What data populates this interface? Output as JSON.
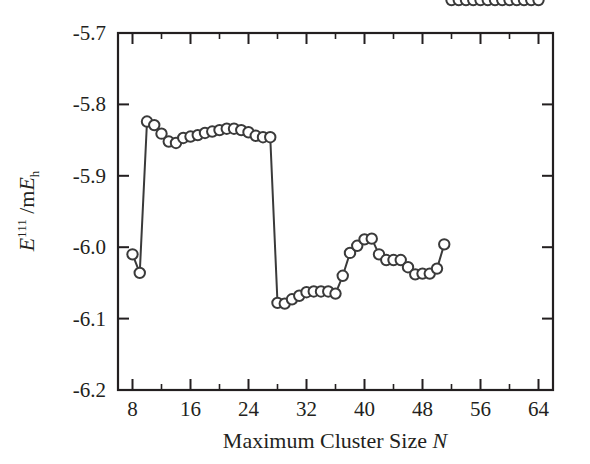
{
  "chart_data": {
    "type": "line",
    "title": "",
    "subtitle": "",
    "xlabel": "Maximum Cluster Size N",
    "ylabel": "E^111 /mE_h",
    "ylabel_parts": {
      "symbol": "E",
      "superscript": "111",
      "separator": " /m",
      "unit_symbol": "E",
      "unit_subscript": "h"
    },
    "xlim": [
      6,
      66
    ],
    "ylim": [
      -6.2,
      -5.7
    ],
    "xticks": [
      8,
      16,
      24,
      32,
      40,
      48,
      56,
      64
    ],
    "xtick_labels": [
      "8",
      "16",
      "24",
      "32",
      "40",
      "48",
      "56",
      "64"
    ],
    "xminor_ticks": [
      12,
      20,
      28,
      36,
      44,
      52,
      60
    ],
    "yticks": [
      -5.7,
      -5.8,
      -5.9,
      -6.0,
      -6.1,
      -6.2
    ],
    "ytick_labels": [
      "-5.7",
      "-5.8",
      "-5.9",
      "-6.0",
      "-6.1",
      "-6.2"
    ],
    "grid": false,
    "legend": null,
    "marker": "open-circle",
    "line_color": "#3a3a3a",
    "marker_face_color": "#ffffff",
    "x": [
      8,
      9,
      10,
      11,
      12,
      13,
      14,
      15,
      16,
      17,
      18,
      19,
      20,
      21,
      22,
      23,
      24,
      25,
      26,
      27,
      28,
      29,
      30,
      31,
      32,
      33,
      34,
      35,
      36,
      37,
      38,
      39,
      40,
      41,
      42,
      43,
      44,
      45,
      46,
      47,
      48,
      49,
      50,
      51,
      52,
      53,
      54,
      55,
      56,
      57,
      58,
      59,
      60,
      61,
      62,
      63,
      64
    ],
    "y": [
      -6.01,
      -6.036,
      -5.824,
      -5.829,
      -5.841,
      -5.852,
      -5.854,
      -5.847,
      -5.845,
      -5.843,
      -5.84,
      -5.838,
      -5.836,
      -5.834,
      -5.834,
      -5.836,
      -5.839,
      -5.844,
      -5.846,
      -5.846,
      -6.078,
      -6.079,
      -6.073,
      -6.068,
      -6.063,
      -6.062,
      -6.062,
      -6.062,
      -6.065,
      -6.04,
      -6.008,
      -5.998,
      -5.989,
      -5.988,
      -6.01,
      -6.018,
      -6.018,
      -6.018,
      -6.028,
      -6.038,
      -6.037,
      -6.037,
      -6.03,
      -5.996
    ],
    "series_note": "Single series of open circles connected by straight line segments"
  },
  "figure": {
    "background": "#ffffff",
    "frame_color": "#231f20"
  }
}
